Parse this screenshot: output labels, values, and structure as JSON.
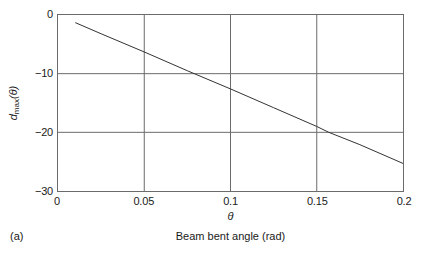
{
  "figure": {
    "panel_label": "(a)",
    "caption": "Beam bent angle (rad)"
  },
  "axis": {
    "y_title_var": "d",
    "y_title_sub": "max",
    "y_title_arg": "(θ)",
    "x_title": "θ"
  },
  "chart_data": {
    "type": "line",
    "title": "",
    "subtitle": "",
    "xlabel": "θ",
    "ylabel": "d_max(θ)",
    "xlim": [
      0,
      0.2
    ],
    "ylim": [
      -30,
      0
    ],
    "grid": true,
    "legend": false,
    "legend_position": "none",
    "xticks": [
      0,
      0.05,
      0.1,
      0.15,
      0.2
    ],
    "xtick_labels": [
      "0",
      "0.05",
      "0.1",
      "0.15",
      "0.2"
    ],
    "yticks": [
      0,
      -10,
      -20,
      -30
    ],
    "ytick_labels": [
      "0",
      "−10",
      "−20",
      "−30"
    ],
    "series": [
      {
        "name": "d_max(θ)",
        "color": "#333333",
        "x": [
          0.01,
          0.025,
          0.05,
          0.075,
          0.079,
          0.1,
          0.125,
          0.15,
          0.157,
          0.175,
          0.2
        ],
        "y": [
          -1.3,
          -3.2,
          -6.3,
          -9.5,
          -10.0,
          -12.6,
          -15.8,
          -19.0,
          -20.0,
          -22.1,
          -25.3
        ]
      }
    ],
    "annotations": [
      "Beam bent angle (rad)",
      "(a)"
    ]
  }
}
